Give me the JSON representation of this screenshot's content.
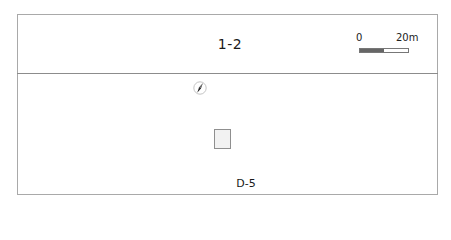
{
  "plan": {
    "title": "1-2",
    "room_label": "D-5"
  },
  "scale_bar": {
    "start_label": "0",
    "end_label": "20m",
    "dark_color": "#666666",
    "light_color": "#ffffff"
  },
  "north_arrow": {
    "icon": "north-arrow-icon",
    "rotation_deg": 30
  },
  "colors": {
    "frame": "#a9a9a9",
    "divider": "#8c8c8c",
    "room_fill": "#f2f2f2",
    "room_border": "#8f8f8f"
  }
}
